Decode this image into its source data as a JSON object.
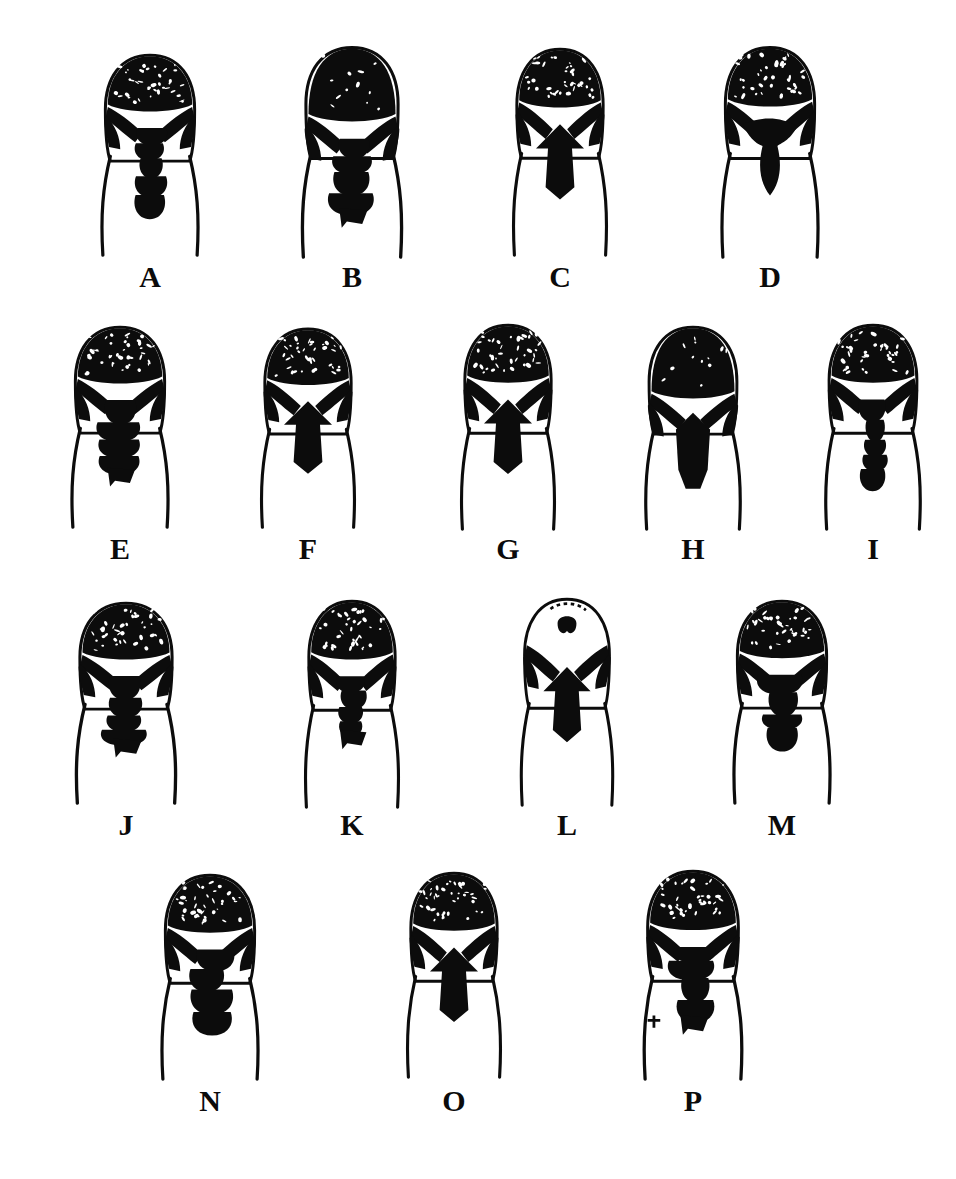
{
  "figure": {
    "kind": "scientific-plate",
    "background_color": "#ffffff",
    "ink_color": "#0c0c0c",
    "label_color": "#0b0b0b",
    "label_font_size_px": 30,
    "rows": [
      {
        "row_index": 1,
        "count": 4,
        "labels": [
          "A",
          "B",
          "C",
          "D"
        ]
      },
      {
        "row_index": 2,
        "count": 5,
        "labels": [
          "E",
          "F",
          "G",
          "H",
          "I"
        ]
      },
      {
        "row_index": 3,
        "count": 4,
        "labels": [
          "J",
          "K",
          "L",
          "M"
        ]
      },
      {
        "row_index": 4,
        "count": 3,
        "labels": [
          "N",
          "O",
          "P"
        ]
      }
    ]
  },
  "specimens": [
    {
      "id": "A",
      "label": "A",
      "row": 1,
      "column": 1,
      "x": 88,
      "y": 48,
      "width": 124,
      "height": 212,
      "label_x": 88,
      "label_y": 262,
      "apex_fill": "solid-speckled",
      "pattern": "narrow ovoid capsule; dark apex with fine pale speckles, paired oblique pale bands forming an X, slender beaded median dark stripe running to base",
      "median_stripe": "beaded, four swellings",
      "outline": "two thin converging side lines below capsule"
    },
    {
      "id": "B",
      "label": "B",
      "row": 1,
      "column": 2,
      "x": 288,
      "y": 40,
      "width": 128,
      "height": 222,
      "label_x": 288,
      "label_y": 262,
      "apex_fill": "solid-dense",
      "pattern": "broad ovoid capsule almost wholly black; two large irregular pale patches on upper flanks; irregular blotchy median mass tapering to an offset foot",
      "median_stripe": "irregular, offset to right near base",
      "outline": "two thin converging side lines below capsule"
    },
    {
      "id": "C",
      "label": "C",
      "row": 1,
      "column": 3,
      "x": 500,
      "y": 42,
      "width": 120,
      "height": 218,
      "label_x": 500,
      "label_y": 262,
      "apex_fill": "solid-speckled",
      "pattern": "capsule with pale V-notch at apex centre; bold dark chevrons forming symmetrical X; broad arrow-head median mass with diamond swelling below",
      "median_stripe": "arrow-head then diamond",
      "outline": "two thin converging side lines below capsule"
    },
    {
      "id": "D",
      "label": "D",
      "row": 1,
      "column": 4,
      "x": 708,
      "y": 40,
      "width": 124,
      "height": 222,
      "label_x": 708,
      "label_y": 262,
      "apex_fill": "solid-speckled",
      "pattern": "capsule with very large unbroken dark apical cap reaching mid-length; clear pale band beneath; mushroom-shaped median mass with narrow stalk",
      "median_stripe": "mushroom / anvil shaped",
      "outline": "two thin widely-splayed side lines below capsule"
    },
    {
      "id": "E",
      "label": "E",
      "row": 2,
      "column": 1,
      "x": 58,
      "y": 320,
      "width": 124,
      "height": 212,
      "label_x": 58,
      "label_y": 534,
      "apex_fill": "solid-speckled",
      "pattern": "capsule with speckled dark apex, pale oblique slits each side, ragged asymmetric median mass of stacked blotches extending well toward base",
      "median_stripe": "ragged, multi-lobed",
      "outline": "two thin converging side lines below capsule"
    },
    {
      "id": "F",
      "label": "F",
      "row": 2,
      "column": 2,
      "x": 248,
      "y": 322,
      "width": 120,
      "height": 210,
      "label_x": 248,
      "label_y": 534,
      "apex_fill": "solid-speckled",
      "pattern": "capsule with dark apex, bold pale inverted-V beneath apex, paired dark arms; long narrow beaded median stripe reaching base",
      "median_stripe": "long, beaded, narrow",
      "outline": "two thin converging side lines below capsule"
    },
    {
      "id": "G",
      "label": "G",
      "row": 2,
      "column": 3,
      "x": 448,
      "y": 318,
      "width": 120,
      "height": 216,
      "label_x": 448,
      "label_y": 534,
      "apex_fill": "solid-speckled",
      "pattern": "capsule with pale oblique bands crossing to form an X; spear-shaped median mass with small lateral lobe and ragged foot",
      "median_stripe": "spear-shaped with lateral lobe",
      "outline": "two thin converging side lines below capsule"
    },
    {
      "id": "H",
      "label": "H",
      "row": 2,
      "column": 4,
      "x": 632,
      "y": 320,
      "width": 122,
      "height": 214,
      "label_x": 632,
      "label_y": 534,
      "apex_fill": "solid-dense",
      "pattern": "capsule with very dark solid apex and only two small pale eye-like slits; broad clear pale band then a wide solid median blade widening at base",
      "median_stripe": "broad solid blade",
      "outline": "two thin widely-splayed side lines below capsule"
    },
    {
      "id": "I",
      "label": "I",
      "row": 2,
      "column": 5,
      "x": 812,
      "y": 318,
      "width": 122,
      "height": 216,
      "label_x": 812,
      "label_y": 534,
      "apex_fill": "solid-speckled",
      "pattern": "capsule with speckled apex, symmetrical pale chevrons, diamond median swelling followed by beaded stripe to base",
      "median_stripe": "diamond then beaded",
      "outline": "two thin converging side lines below capsule"
    },
    {
      "id": "J",
      "label": "J",
      "row": 3,
      "column": 1,
      "x": 62,
      "y": 596,
      "width": 128,
      "height": 212,
      "label_x": 62,
      "label_y": 810,
      "apex_fill": "solid-speckled",
      "pattern": "broad capsule with heavily speckled dark apex, small white eye-spot at centre, broad ragged median mass running to base",
      "median_stripe": "broad, ragged, continuous",
      "outline": "two thin converging side lines below capsule"
    },
    {
      "id": "K",
      "label": "K",
      "row": 3,
      "column": 2,
      "x": 292,
      "y": 594,
      "width": 120,
      "height": 218,
      "label_x": 292,
      "label_y": 810,
      "apex_fill": "solid-speckled",
      "pattern": "capsule with speckled apex and pale lateral wedges; paired dark limb-like bars; elongate median mass with hooked foot at base",
      "median_stripe": "elongate with hooked foot",
      "outline": "two thin converging side lines below capsule"
    },
    {
      "id": "L",
      "label": "L",
      "row": 3,
      "column": 3,
      "x": 508,
      "y": 592,
      "width": 118,
      "height": 218,
      "label_x": 508,
      "label_y": 810,
      "apex_fill": "outline-open",
      "pattern": "capsule with mostly pale apex outlined in ink and a small dark horseshoe mark at centre; dark limb-like bars below; narrow beaded median stripe with splayed foot",
      "median_stripe": "narrow beaded with splayed foot",
      "outline": "two thin converging side lines below capsule"
    },
    {
      "id": "M",
      "label": "M",
      "row": 3,
      "column": 4,
      "x": 720,
      "y": 594,
      "width": 124,
      "height": 214,
      "label_x": 720,
      "label_y": 810,
      "apex_fill": "solid-speckled",
      "pattern": "capsule with speckled apex, wide pale chevrons, heavy median mass of stacked swellings with broad base",
      "median_stripe": "stacked swellings",
      "outline": "two thin converging side lines below capsule"
    },
    {
      "id": "N",
      "label": "N",
      "row": 4,
      "column": 1,
      "x": 148,
      "y": 868,
      "width": 124,
      "height": 216,
      "label_x": 148,
      "label_y": 1086,
      "apex_fill": "solid-speckled",
      "pattern": "capsule with speckled apex, pale lateral wedges, slanted dark bars; bulky median mass offset slightly right with lobed base",
      "median_stripe": "bulky, slightly offset",
      "outline": "two thin converging side lines below capsule"
    },
    {
      "id": "O",
      "label": "O",
      "row": 4,
      "column": 2,
      "x": 394,
      "y": 866,
      "width": 120,
      "height": 216,
      "label_x": 394,
      "label_y": 1086,
      "apex_fill": "solid-speckled",
      "pattern": "capsule with speckled apex, symmetrical pale X, large arrow-head median mass tapering to a small ragged foot",
      "median_stripe": "arrow-head tapering to foot",
      "outline": "two thin converging side lines below capsule"
    },
    {
      "id": "P",
      "label": "P",
      "row": 4,
      "column": 3,
      "x": 630,
      "y": 864,
      "width": 126,
      "height": 220,
      "label_x": 630,
      "label_y": 1086,
      "apex_fill": "solid-speckled",
      "pattern": "largest capsule; heavily speckled apex, complex branched dark markings on both flanks, broad irregular median mass with ragged base and small tick mark on left margin",
      "median_stripe": "broad irregular, ragged base",
      "outline": "two thin converging side lines below capsule"
    }
  ]
}
